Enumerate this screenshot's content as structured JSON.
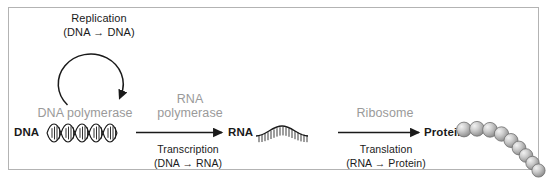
{
  "figure": {
    "background_color": "#ffffff",
    "border_color": "#b3b3b3",
    "gray_text_color": "#9a9a9a",
    "black_text_color": "#1a1a1a"
  },
  "replication": {
    "title": "Replication",
    "subtitle": "(DNA → DNA)",
    "enzyme": "DNA polymerase",
    "arrow_shape": "circular-loop-clockwise"
  },
  "transcription": {
    "enzyme_line1": "RNA",
    "enzyme_line2": "polymerase",
    "process": "Transcription",
    "conversion": "(DNA → RNA)",
    "arrow_shape": "straight-right"
  },
  "translation": {
    "enzyme": "Ribosome",
    "process": "Translation",
    "conversion": "(RNA → Protein)",
    "arrow_shape": "straight-right"
  },
  "molecules": {
    "dna_label": "DNA",
    "rna_label": "RNA",
    "protein_label": "Protein",
    "dna_shape": "double-helix",
    "dna_turns": 3,
    "rna_shape": "single-strand-wave",
    "protein_shape": "bead-chain",
    "protein_bead_count": 9,
    "protein_bead_color": "#b8b8b8"
  }
}
